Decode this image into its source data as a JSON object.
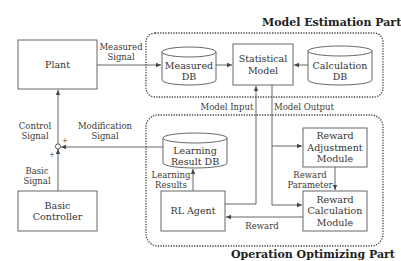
{
  "regions": {
    "model_estimation": {
      "title": "Model Estimation Part"
    },
    "operation_optimizing": {
      "title": "Operation Optimizing Part"
    }
  },
  "blocks": {
    "plant": "Plant",
    "basic_controller": [
      "Basic",
      "Controller"
    ],
    "measured_db": [
      "Measured",
      "DB"
    ],
    "statistical_model": [
      "Statistical",
      "Model"
    ],
    "calculation_db": [
      "Calculation",
      "DB"
    ],
    "learning_result_db": [
      "Learning",
      "Result DB"
    ],
    "rl_agent": "RL Agent",
    "reward_adjustment_module": [
      "Reward",
      "Adjustment",
      "Module"
    ],
    "reward_calculation_module": [
      "Reward",
      "Calculation",
      "Module"
    ]
  },
  "signals": {
    "measured_signal": [
      "Measured",
      "Signal"
    ],
    "control_signal": [
      "Control",
      "Signal"
    ],
    "modification_signal": [
      "Modification",
      "Signal"
    ],
    "basic_signal": [
      "Basic",
      "Signal"
    ],
    "model_input": "Model Input",
    "model_output": "Model Output",
    "learning_results": [
      "Learning",
      "Results"
    ],
    "reward_parameter": [
      "Reward",
      "Parameter"
    ],
    "reward": "Reward"
  },
  "junction": {
    "plus_top": "+",
    "plus_left": "+"
  },
  "colors": {
    "line": "#555555",
    "dotted": "#444444",
    "background": "#ffffff"
  }
}
